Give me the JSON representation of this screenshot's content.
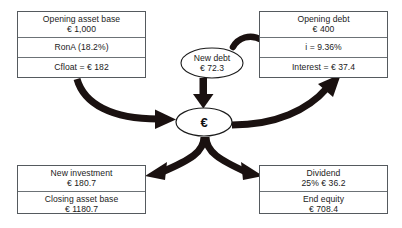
{
  "diagram": {
    "colors": {
      "arrow": "#1a1110",
      "box_border": "#555a5e",
      "row_divider": "#6c7276",
      "text": "#1b1b1b",
      "background": "#ffffff"
    },
    "boxes": {
      "top_left": {
        "name": "opening-asset-base-box",
        "rows": [
          {
            "line1": "Opening asset base",
            "line2": "€ 1,000"
          },
          {
            "line1": "RonA (18.2%)",
            "line2": ""
          },
          {
            "line1": "Cfloat = € 182",
            "line2": ""
          }
        ]
      },
      "top_right": {
        "name": "opening-debt-box",
        "rows": [
          {
            "line1": "Opening debt",
            "line2": "€ 400"
          },
          {
            "line1": "i = 9.36%",
            "line2": ""
          },
          {
            "line1": "Interest = € 37.4",
            "line2": ""
          }
        ]
      },
      "bottom_left": {
        "name": "investment-box",
        "rows": [
          {
            "line1": "New investment",
            "line2": "€ 180.7"
          },
          {
            "line1": "Closing asset base",
            "line2": "€ 1180.7"
          }
        ]
      },
      "bottom_right": {
        "name": "equity-box",
        "rows": [
          {
            "line1": "Dividend",
            "line2": "25%  € 36.2"
          },
          {
            "line1": "End equity",
            "line2": "€ 708.4"
          }
        ]
      }
    },
    "ellipses": {
      "new_debt": {
        "line1": "New debt",
        "line2": "€ 72.3"
      },
      "hub": {
        "symbol": "€"
      }
    }
  }
}
